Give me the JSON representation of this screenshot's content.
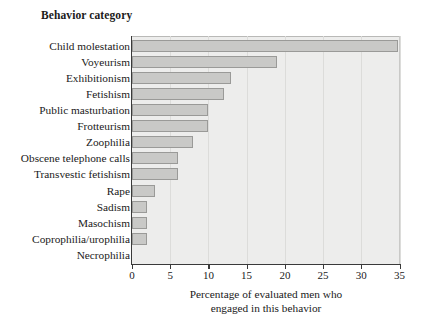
{
  "figure": {
    "category_axis_title": "Behavior category",
    "xlabel_line1": "Percentage of evaluated men who",
    "xlabel_line2": "engaged in this behavior"
  },
  "chart_data": {
    "type": "bar",
    "orientation": "horizontal",
    "title": "",
    "xlabel": "Percentage of evaluated men who engaged in this behavior",
    "ylabel": "Behavior category",
    "xlim": [
      0,
      35
    ],
    "xticks": [
      0,
      5,
      10,
      15,
      20,
      25,
      30,
      35
    ],
    "grid": true,
    "legend": "none",
    "bar_fill_color": "#c9c9c7",
    "bar_edge_color": "#9a9a98",
    "plot_background_color": "#ededec",
    "categories": [
      "Child molestation",
      "Voyeurism",
      "Exhibitionism",
      "Fetishism",
      "Public masturbation",
      "Frotteurism",
      "Zoophilia",
      "Obscene telephone calls",
      "Transvestic fetishism",
      "Rape",
      "Sadism",
      "Masochism",
      "Coprophilia/urophilia",
      "Necrophilia"
    ],
    "values": [
      34.8,
      19,
      13,
      12,
      10,
      10,
      8,
      6,
      6,
      3,
      2,
      2,
      2,
      0
    ]
  }
}
